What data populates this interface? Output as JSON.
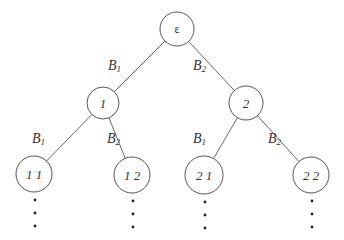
{
  "diagram": {
    "type": "binary-tree",
    "nodes": [
      {
        "id": "root",
        "label": "ε",
        "cx": 177,
        "cy": 29,
        "r": 17
      },
      {
        "id": "n1",
        "label": "1",
        "cx": 103,
        "cy": 103,
        "r": 16
      },
      {
        "id": "n2",
        "label": "2",
        "cx": 246,
        "cy": 103,
        "r": 17
      },
      {
        "id": "n11",
        "label": "1 1",
        "cx": 34,
        "cy": 174,
        "r": 18
      },
      {
        "id": "n12",
        "label": "1 2",
        "cx": 132,
        "cy": 175,
        "r": 18
      },
      {
        "id": "n21",
        "label": "2 1",
        "cx": 204,
        "cy": 175,
        "r": 19
      },
      {
        "id": "n22",
        "label": "2 2",
        "cx": 311,
        "cy": 175,
        "r": 18
      }
    ],
    "edges": [
      {
        "from": "root",
        "to": "n1",
        "label_main": "B",
        "label_sub": "1",
        "lx": 108,
        "ly": 70
      },
      {
        "from": "root",
        "to": "n2",
        "label_main": "B",
        "label_sub": "2",
        "lx": 193,
        "ly": 70
      },
      {
        "from": "n1",
        "to": "n11",
        "label_main": "B",
        "label_sub": "1",
        "lx": 32,
        "ly": 143
      },
      {
        "from": "n1",
        "to": "n12",
        "label_main": "B",
        "label_sub": "2",
        "lx": 107,
        "ly": 143
      },
      {
        "from": "n2",
        "to": "n21",
        "label_main": "B",
        "label_sub": "1",
        "lx": 193,
        "ly": 143
      },
      {
        "from": "n2",
        "to": "n22",
        "label_main": "B",
        "label_sub": "2",
        "lx": 268,
        "ly": 143
      }
    ],
    "continuation": "vertical ellipsis below each leaf"
  }
}
